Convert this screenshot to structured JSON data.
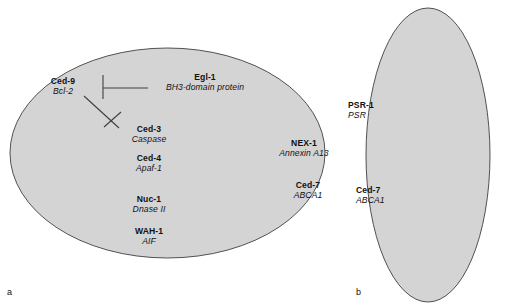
{
  "figure": {
    "style": {
      "cell_fill": "#d4d4d4",
      "cell_stroke": "#3f3f3f",
      "line_color": "#3f3f3f",
      "text_color": "#111111",
      "background": "#ffffff"
    },
    "panels": [
      {
        "letter": "a",
        "name": "dying-cell"
      },
      {
        "letter": "b",
        "name": "engulfing-cell"
      }
    ],
    "dying_cell": {
      "labels": {
        "ced9": {
          "gene": "Ced-9",
          "protein": "Bcl-2"
        },
        "egl1": {
          "gene": "Egl-1",
          "protein": "BH3-domain protein"
        },
        "ced3": {
          "gene": "Ced-3",
          "protein": "Caspase"
        },
        "ced4": {
          "gene": "Ced-4",
          "protein": "Apaf-1"
        },
        "nuc1": {
          "gene": "Nuc-1",
          "protein": "Dnase II"
        },
        "wah1": {
          "gene": "WAH-1",
          "protein": "AIF"
        },
        "nex1": {
          "gene": "NEX-1",
          "protein": "Annexin A13"
        },
        "ced7": {
          "gene": "Ced-7",
          "protein": "ABCA1"
        }
      },
      "interactions": [
        {
          "source": "Egl-1",
          "target": "Ced-9",
          "type": "inhibition"
        },
        {
          "source": "Ced-9",
          "target": "Ced-3",
          "type": "inhibition"
        }
      ]
    },
    "engulfing_cell": {
      "labels": {
        "psr1": {
          "gene": "PSR-1",
          "protein": "PSR"
        },
        "ced7": {
          "gene": "Ced-7",
          "protein": "ABCA1"
        }
      }
    }
  }
}
